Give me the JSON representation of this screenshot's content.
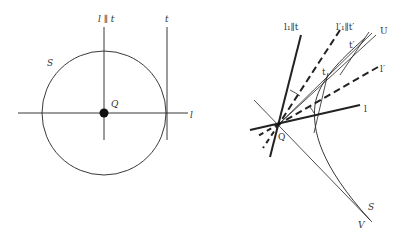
{
  "left_figure": {
    "labels": {
      "circle": "S",
      "center": "Q",
      "horizontal_line": "l",
      "vertical_line": "l ∥ t",
      "tangent_line": "t"
    },
    "circle": {
      "cx": 104,
      "cy": 113,
      "r": 62
    },
    "center_point": {
      "x": 104,
      "y": 113
    }
  },
  "right_figure": {
    "labels": {
      "l1_parallel_t": "l₁∥t",
      "l1p_parallel_tp": "l′₁∥t′",
      "u": "U",
      "t_prime": "t′",
      "l_prime": "l′",
      "t": "t",
      "l": "l",
      "q": "Q",
      "s": "S",
      "v": "V"
    },
    "origin_point": {
      "x": 279,
      "y": 124
    }
  }
}
